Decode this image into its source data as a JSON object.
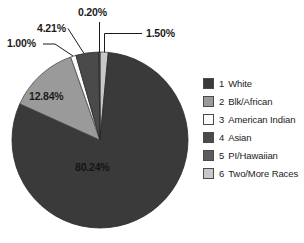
{
  "chart_data": {
    "type": "pie",
    "title": "",
    "subtitle": "",
    "xlabel": "",
    "ylabel": "",
    "legend_position": "right",
    "grid": false,
    "start_angle_deg": 0,
    "direction": "clockwise",
    "categories": [
      "White",
      "Blk/African",
      "American Indian",
      "Asian",
      "PI/Hawaiian",
      "Two/More Races"
    ],
    "values": [
      80.24,
      12.84,
      1.0,
      4.21,
      0.2,
      1.5
    ],
    "value_unit": "%",
    "slices": [
      {
        "index": 1,
        "key": "white",
        "label": "White",
        "value": 80.24,
        "value_text": "80.24%",
        "color": "#3a3a3a",
        "edge": "#2a2a2a"
      },
      {
        "index": 2,
        "key": "blk-african",
        "label": "Blk/African",
        "value": 12.84,
        "value_text": "12.84%",
        "color": "#9a9a9a",
        "edge": "#4a4a4a"
      },
      {
        "index": 3,
        "key": "american-indian",
        "label": "American Indian",
        "value": 1.0,
        "value_text": "1.00%",
        "color": "#fbfbfb",
        "edge": "#4a4a4a"
      },
      {
        "index": 4,
        "key": "asian",
        "label": "Asian",
        "value": 4.21,
        "value_text": "4.21%",
        "color": "#4a4a4a",
        "edge": "#2a2a2a"
      },
      {
        "index": 5,
        "key": "pi-hawaiian",
        "label": "PI/Hawaiian",
        "value": 0.2,
        "value_text": "0.20%",
        "color": "#5c5c5c",
        "edge": "#2a2a2a"
      },
      {
        "index": 6,
        "key": "two-more-races",
        "label": "Two/More Races",
        "value": 1.5,
        "value_text": "1.50%",
        "color": "#c8c8c8",
        "edge": "#4a4a4a"
      }
    ],
    "data_labels": [
      {
        "key": "pct-1-50",
        "text": "1.50%",
        "leader": true
      },
      {
        "key": "pct-0-20",
        "text": "0.20%",
        "leader": true
      },
      {
        "key": "pct-4-21",
        "text": "4.21%",
        "leader": true
      },
      {
        "key": "pct-1-00",
        "text": "1.00%",
        "leader": true
      },
      {
        "key": "pct-12-84",
        "text": "12.84%",
        "leader": false
      },
      {
        "key": "pct-80-24",
        "text": "80.24%",
        "leader": false
      }
    ]
  },
  "legend": {
    "items": [
      {
        "num": "1",
        "label": "White",
        "color": "#3a3a3a"
      },
      {
        "num": "2",
        "label": "Blk/African",
        "color": "#9a9a9a"
      },
      {
        "num": "3",
        "label": "American Indian",
        "color": "#fbfbfb"
      },
      {
        "num": "4",
        "label": "Asian",
        "color": "#4a4a4a"
      },
      {
        "num": "5",
        "label": "PI/Hawaiian",
        "color": "#5c5c5c"
      },
      {
        "num": "6",
        "label": "Two/More Races",
        "color": "#c8c8c8"
      }
    ]
  }
}
